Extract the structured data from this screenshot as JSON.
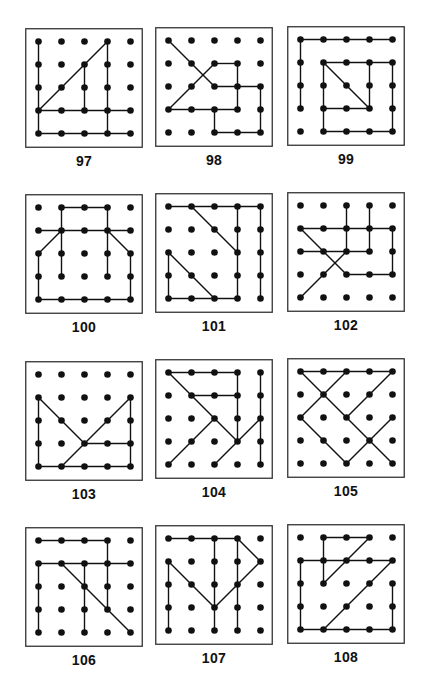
{
  "header": {
    "fragment": ""
  },
  "grid": {
    "size": 5,
    "origin": 13,
    "spacing": 23,
    "dot_radius": 3.3,
    "line_color": "#111111",
    "box_color": "#333333"
  },
  "panels": [
    {
      "label": "97",
      "x": 25,
      "y": 28,
      "segments": [
        [
          0,
          0,
          0,
          4
        ],
        [
          0,
          4,
          4,
          4
        ],
        [
          0,
          3,
          4,
          3
        ],
        [
          0,
          3,
          3,
          0
        ],
        [
          3,
          0,
          3,
          4
        ],
        [
          2,
          1,
          2,
          3
        ]
      ]
    },
    {
      "label": "98",
      "x": 155,
      "y": 27,
      "segments": [
        [
          0,
          0,
          2,
          2
        ],
        [
          0,
          3,
          2,
          1
        ],
        [
          2,
          1,
          3,
          1
        ],
        [
          3,
          1,
          3,
          3
        ],
        [
          2,
          2,
          4,
          2
        ],
        [
          4,
          2,
          4,
          4
        ],
        [
          2,
          4,
          4,
          4
        ],
        [
          2,
          3,
          2,
          4
        ],
        [
          0,
          3,
          3,
          3
        ]
      ]
    },
    {
      "label": "99",
      "x": 287,
      "y": 26,
      "segments": [
        [
          0,
          0,
          4,
          0
        ],
        [
          0,
          0,
          0,
          3
        ],
        [
          1,
          1,
          4,
          1
        ],
        [
          1,
          1,
          1,
          4
        ],
        [
          1,
          1,
          3,
          3
        ],
        [
          1,
          3,
          3,
          3
        ],
        [
          3,
          1,
          3,
          3
        ],
        [
          4,
          1,
          4,
          4
        ],
        [
          1,
          4,
          4,
          4
        ]
      ]
    },
    {
      "label": "100",
      "x": 25,
      "y": 194,
      "segments": [
        [
          1,
          0,
          3,
          0
        ],
        [
          1,
          0,
          1,
          3
        ],
        [
          3,
          0,
          3,
          3
        ],
        [
          0,
          1,
          4,
          1
        ],
        [
          1,
          1,
          0,
          2
        ],
        [
          3,
          1,
          4,
          2
        ],
        [
          0,
          2,
          0,
          4
        ],
        [
          4,
          2,
          4,
          4
        ],
        [
          0,
          4,
          4,
          4
        ]
      ]
    },
    {
      "label": "101",
      "x": 155,
      "y": 193,
      "segments": [
        [
          0,
          0,
          4,
          0
        ],
        [
          1,
          0,
          3,
          2
        ],
        [
          3,
          0,
          3,
          4
        ],
        [
          4,
          0,
          4,
          4
        ],
        [
          0,
          2,
          0,
          4
        ],
        [
          0,
          2,
          2,
          4
        ],
        [
          0,
          4,
          3,
          4
        ]
      ]
    },
    {
      "label": "102",
      "x": 287,
      "y": 192,
      "segments": [
        [
          2,
          0,
          2,
          2
        ],
        [
          3,
          0,
          3,
          2
        ],
        [
          0,
          1,
          4,
          1
        ],
        [
          4,
          1,
          4,
          3
        ],
        [
          0,
          1,
          2,
          3
        ],
        [
          0,
          2,
          3,
          2
        ],
        [
          2,
          3,
          4,
          3
        ],
        [
          0,
          4,
          2,
          2
        ]
      ]
    },
    {
      "label": "103",
      "x": 25,
      "y": 361,
      "segments": [
        [
          0,
          1,
          0,
          4
        ],
        [
          0,
          1,
          2,
          3
        ],
        [
          4,
          1,
          2,
          3
        ],
        [
          4,
          1,
          4,
          4
        ],
        [
          2,
          3,
          4,
          3
        ],
        [
          2,
          3,
          1,
          4
        ],
        [
          0,
          4,
          4,
          4
        ]
      ]
    },
    {
      "label": "104",
      "x": 155,
      "y": 359,
      "segments": [
        [
          0,
          0,
          3,
          0
        ],
        [
          0,
          0,
          3,
          3
        ],
        [
          1,
          1,
          3,
          1
        ],
        [
          3,
          0,
          3,
          3
        ],
        [
          4,
          0,
          4,
          4
        ],
        [
          0,
          4,
          2,
          2
        ],
        [
          2,
          4,
          4,
          2
        ]
      ]
    },
    {
      "label": "105",
      "x": 287,
      "y": 358,
      "segments": [
        [
          0,
          0,
          4,
          0
        ],
        [
          0,
          0,
          4,
          4
        ],
        [
          2,
          0,
          0,
          2
        ],
        [
          0,
          2,
          2,
          4
        ],
        [
          2,
          4,
          4,
          2
        ],
        [
          4,
          0,
          2,
          2
        ]
      ]
    },
    {
      "label": "106",
      "x": 25,
      "y": 527,
      "segments": [
        [
          0,
          0,
          3,
          0
        ],
        [
          3,
          0,
          3,
          3
        ],
        [
          0,
          1,
          4,
          1
        ],
        [
          0,
          1,
          0,
          4
        ],
        [
          2,
          1,
          2,
          4
        ],
        [
          1,
          1,
          4,
          4
        ]
      ]
    },
    {
      "label": "107",
      "x": 155,
      "y": 525,
      "segments": [
        [
          0,
          0,
          3,
          0
        ],
        [
          3,
          0,
          4,
          1
        ],
        [
          4,
          1,
          2,
          3
        ],
        [
          0,
          1,
          2,
          3
        ],
        [
          0,
          1,
          0,
          4
        ],
        [
          2,
          0,
          2,
          4
        ],
        [
          3,
          0,
          3,
          4
        ]
      ]
    },
    {
      "label": "108",
      "x": 287,
      "y": 524,
      "segments": [
        [
          1,
          0,
          3,
          0
        ],
        [
          1,
          0,
          1,
          2
        ],
        [
          3,
          0,
          1,
          2
        ],
        [
          0,
          1,
          4,
          1
        ],
        [
          0,
          1,
          0,
          4
        ],
        [
          4,
          1,
          1,
          4
        ],
        [
          4,
          2,
          4,
          4
        ],
        [
          0,
          4,
          4,
          4
        ]
      ]
    }
  ]
}
